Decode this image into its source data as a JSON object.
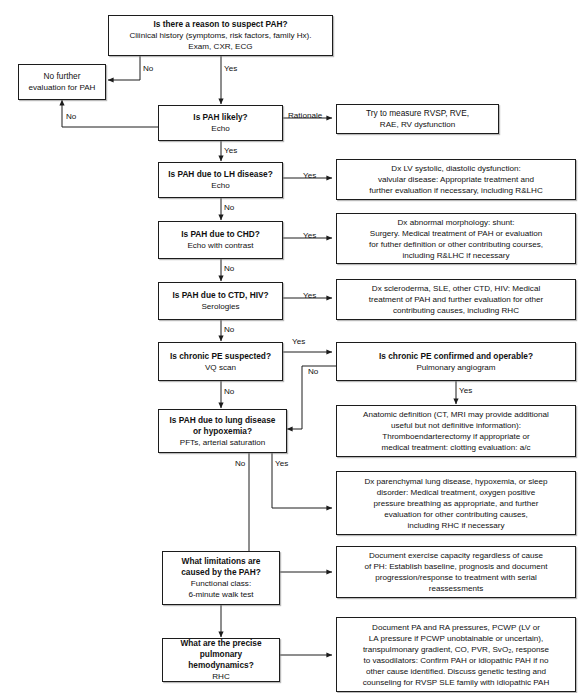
{
  "diagram": {
    "stroke_color": "#1c1c1c",
    "background_color": "#ffffff",
    "text_color": "#111111"
  },
  "nodes": {
    "suspect_pah": {
      "title": "Is there a reason to suspect PAH?",
      "line2": "Cliinical history (symptoms, risk factors, family Hx).",
      "line3": "Exam, CXR, ECG"
    },
    "no_further_eval": {
      "line1": "No further",
      "line2": "evaluation for PAH"
    },
    "pah_likely": {
      "title": "Is PAH likely?",
      "line2": "Echo"
    },
    "rvsp_measure": {
      "line1": "Try to measure RVSP, RVE,",
      "line2": "RAE, RV dysfunction"
    },
    "lh_disease": {
      "title": "Is PAH due to LH disease?",
      "line2": "Echo"
    },
    "lh_disease_action": {
      "line1": "Dx LV systolic, diastolic dysfunction:",
      "line2": "valvular disease: Appropriate treatment and",
      "line3": "further evaluation if necessary, including R&LHC"
    },
    "chd": {
      "title": "Is PAH due to CHD?",
      "line2": "Echo with contrast"
    },
    "chd_action": {
      "line1": "Dx abnormal morphology: shunt:",
      "line2": "Surgery. Medical treatment of PAH or evaluation",
      "line3": "for futher definition or other contributing courses,",
      "line4": "including R&LHC if necessary"
    },
    "ctd_hiv": {
      "title": "Is PAH due to CTD, HIV?",
      "line2": "Serologies"
    },
    "ctd_hiv_action": {
      "line1": "Dx scleroderma, SLE, other CTD, HIV: Medical",
      "line2": "treatment of PAH and further evaluation for other",
      "line3": "contributing causes, including RHC"
    },
    "chronic_pe_suspected": {
      "title": "Is chronic PE suspected?",
      "line2": "VQ scan"
    },
    "chronic_pe_operable": {
      "title": "Is chronic PE confirmed and operable?",
      "line2": "Pulmonary angiogram"
    },
    "anatomic_definition": {
      "line1": "Anatomic definition (CT, MRI may provide additional",
      "line2": "useful but not definitive information):",
      "line3": "Thromboendarterectomy if appropriate or",
      "line4": "medical treatment: clotting evaluation: a/c"
    },
    "lung_disease": {
      "title1": "Is PAH due to lung disease",
      "title2": "or hypoxemia?",
      "line3": "PFTs, arterial saturation"
    },
    "parenchymal_action": {
      "line1": "Dx parenchymal lung disease, hypoxemia, or sleep",
      "line2": "disorder: Medical treatment, oxygen positive",
      "line3": "pressure breathing as appropriate, and further",
      "line4": "evaluation for other contributing causes,",
      "line5": "including RHC if necessary"
    },
    "limitations": {
      "title1": "What limitations are",
      "title2": "caused by the PAH?",
      "line3": "Functional class:",
      "line4": "6-minute walk test"
    },
    "limitations_action": {
      "line1": "Document exercise capacity regardless of cause",
      "line2": "of PH: Establish baseline, prognosis and document",
      "line3": "progression/response to treatment with serial",
      "line4": "reassessments"
    },
    "hemodynamics": {
      "title1": "What are the precise",
      "title2": "pulmonary hemodynamics?",
      "line3": "RHC"
    },
    "hemodynamics_action": {
      "line1": "Document PA and RA pressures, PCWP (LV or",
      "line2": "LA pressure if PCWP unobtainable or uncertain),",
      "line3": "transpulmonary gradient, CO, PVR, SvO₂, response",
      "line4": "to vasodilators: Confirm PAH or idiopathic PAH if no",
      "line5": "other cause identified. Discuss genetic testing and",
      "line6": "counseling for RVSP SLE family with idiopathic PAH"
    }
  },
  "edge_labels": {
    "suspect_no": "No",
    "suspect_yes": "Yes",
    "likely_no": "No",
    "likely_yes": "Yes",
    "likely_rationale": "Rationale",
    "lh_yes": "Yes",
    "lh_no": "No",
    "chd_yes": "Yes",
    "chd_no": "No",
    "ctd_yes": "Yes",
    "ctd_no": "No",
    "pe_yes": "Yes",
    "pe_no": "No",
    "operable_no": "No",
    "operable_yes": "Yes",
    "lung_no": "No",
    "lung_yes": "Yes"
  }
}
